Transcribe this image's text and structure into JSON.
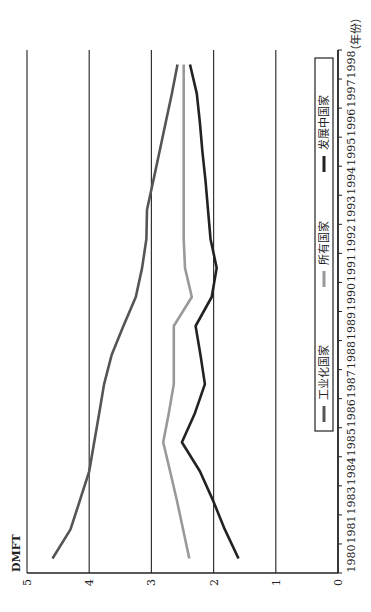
{
  "chart_data": {
    "type": "line",
    "title": "",
    "xlabel": "（年份）",
    "ylabel": "DMFT",
    "ylim": [
      0,
      5
    ],
    "yticks": [
      0,
      1,
      2,
      3,
      4,
      5
    ],
    "grid": "horizontal",
    "legend_position": "top-inside",
    "categories": [
      "1980",
      "1981",
      "1983",
      "1984",
      "1985",
      "1986",
      "1987",
      "1988",
      "1989",
      "1990",
      "1991",
      "1992",
      "1993",
      "1994",
      "1995",
      "1996",
      "1997",
      "1998"
    ],
    "series": [
      {
        "name": "工业化国家",
        "color": "#555555",
        "values": [
          4.59,
          4.3,
          4.15,
          4.0,
          3.92,
          3.84,
          3.76,
          3.64,
          3.45,
          3.25,
          3.15,
          3.08,
          3.07,
          2.97,
          2.87,
          2.77,
          2.67,
          2.58
        ]
      },
      {
        "name": "所有国家",
        "color": "#999999",
        "values": [
          2.39,
          2.49,
          2.59,
          2.7,
          2.81,
          2.72,
          2.64,
          2.64,
          2.64,
          2.35,
          2.46,
          2.48,
          2.48,
          2.48,
          2.48,
          2.48,
          2.48,
          2.48
        ]
      },
      {
        "name": "发展中国家",
        "color": "#222222",
        "values": [
          1.6,
          1.82,
          2.01,
          2.22,
          2.51,
          2.3,
          2.14,
          2.21,
          2.29,
          2.03,
          1.95,
          2.05,
          2.09,
          2.13,
          2.18,
          2.22,
          2.27,
          2.38
        ]
      }
    ]
  }
}
